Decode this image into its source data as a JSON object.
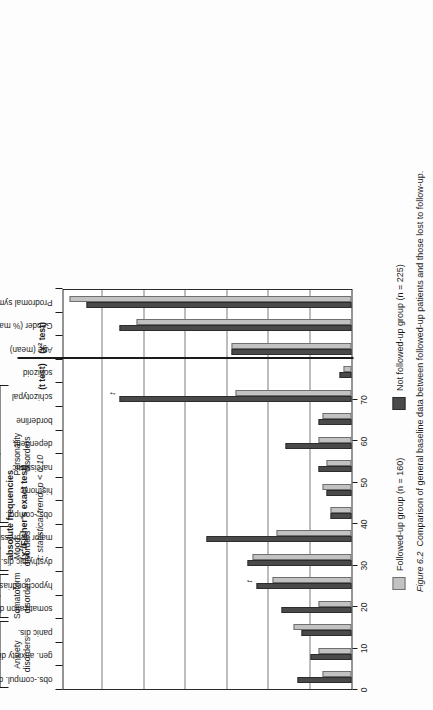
{
  "figure": {
    "number": "Figure 6.2",
    "caption": "Comparison of general baseline data between followed-up patients and those lost to follow-up."
  },
  "annotations": {
    "headline_line1": "absolute frequencies",
    "headline_line2_pre": "(",
    "headline_line2_chi": "χ",
    "headline_line2_sup": "2",
    "headline_line2_post": "/Fisher's exact test)",
    "trend_note_marker": "t",
    "trend_note_text": ": statistical trend, p < 0.10",
    "divider_label_left": "(t test)",
    "divider_label_right_pre": "(",
    "divider_label_right_chi": "χ",
    "divider_label_right_sup": "2",
    "divider_label_right_post": " test)"
  },
  "legend": {
    "position": "right",
    "items": [
      {
        "label": "Followed-up group (n = 160)",
        "color": "#c2c2c2",
        "key": "followed-up"
      },
      {
        "label": "Not followed-up group (n = 225)",
        "color": "#4a4a4a",
        "key": "not-followed-up"
      }
    ]
  },
  "groups": [
    {
      "label_line1": "Anxiety",
      "label_line2": "disorders",
      "start": 0,
      "end": 2
    },
    {
      "label_line1": "Somatoform",
      "label_line2": "disorders",
      "start": 3,
      "end": 4
    },
    {
      "label_line1": "Mood",
      "label_line2": "disorders",
      "start": 5,
      "end": 6
    },
    {
      "label_line1": "Personality",
      "label_line2": "disorders",
      "start": 7,
      "end": 12
    }
  ],
  "trend_markers": [
    4,
    12
  ],
  "chart_data": {
    "type": "bar",
    "title": "Comparison of general baseline data between followed-up patients and those lost to follow-up.",
    "xlabel": "",
    "ylabel": "",
    "ylim": [
      0,
      70
    ],
    "yticks": [
      0,
      10,
      20,
      30,
      40,
      50,
      60,
      70
    ],
    "grid": true,
    "orientation": "vertical",
    "legend_position": "right",
    "categories": [
      "obs.-compul. dis.",
      "gen. anxiety dis.",
      "panic dis.",
      "somatization dis.",
      "hypochondriasis",
      "dysthymic dis.",
      "major depression",
      "obs.-compul.",
      "histrionic",
      "narcissistic",
      "dependent",
      "borderline",
      "schizotypal",
      "schizoid",
      "Age (mean)",
      "Gender (% male)",
      "Prodromal symptoms (% present)"
    ],
    "series": [
      {
        "name": "Not followed-up group (n = 225)",
        "color": "#4a4a4a",
        "values": [
          13,
          10,
          12,
          17,
          23,
          25,
          35,
          5,
          6,
          8,
          16,
          8,
          56,
          3,
          29,
          56,
          64
        ]
      },
      {
        "name": "Followed-up group (n = 160)",
        "color": "#c2c2c2",
        "values": [
          7,
          8,
          14,
          8,
          19,
          24,
          18,
          5,
          7,
          6,
          8,
          7,
          28,
          2,
          29,
          52,
          68
        ]
      }
    ]
  }
}
